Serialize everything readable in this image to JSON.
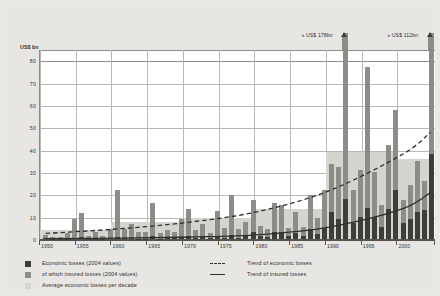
{
  "chart_data": {
    "type": "bar",
    "title": "",
    "xlabel": "",
    "ylabel": "US$ bn",
    "ylim": [
      0,
      85
    ],
    "xlim": [
      1950,
      2004
    ],
    "grid": true,
    "yticks": [
      0,
      10,
      20,
      30,
      40,
      50,
      60,
      70,
      80
    ],
    "ytick_labels": [
      "0",
      "10",
      "20",
      "30",
      "40",
      "50",
      "60",
      "70",
      "80"
    ],
    "xticks": [
      1950,
      1955,
      1960,
      1965,
      1970,
      1975,
      1980,
      1985,
      1990,
      1995,
      2000
    ],
    "xtick_labels": [
      "1950",
      "1955",
      "1960",
      "1965",
      "1970",
      "1975",
      "1980",
      "1985",
      "1990",
      "1995",
      "2000"
    ],
    "legend_position": "below-plot",
    "years": [
      1950,
      1951,
      1952,
      1953,
      1954,
      1955,
      1956,
      1957,
      1958,
      1959,
      1960,
      1961,
      1962,
      1963,
      1964,
      1965,
      1966,
      1967,
      1968,
      1969,
      1970,
      1971,
      1972,
      1973,
      1974,
      1975,
      1976,
      1977,
      1978,
      1979,
      1980,
      1981,
      1982,
      1983,
      1984,
      1985,
      1986,
      1987,
      1988,
      1989,
      1990,
      1991,
      1992,
      1993,
      1994,
      1995,
      1996,
      1997,
      1998,
      1999,
      2000,
      2001,
      2002,
      2003,
      2004
    ],
    "series": [
      {
        "name": "Economic losses (2004 values)",
        "color": "#8d8d88",
        "values": [
          2.0,
          1.0,
          1.0,
          2.5,
          9.0,
          11.5,
          1.5,
          3.0,
          1.5,
          4.5,
          22.0,
          4.5,
          6.5,
          3.0,
          3.0,
          16.0,
          2.5,
          4.0,
          3.0,
          9.0,
          13.5,
          4.0,
          6.5,
          2.5,
          12.5,
          5.0,
          19.5,
          4.5,
          7.5,
          17.5,
          6.0,
          4.5,
          16.0,
          15.0,
          5.0,
          12.0,
          5.5,
          19.5,
          9.5,
          22.0,
          33.5,
          32.0,
          49.5,
          22.0,
          31.0,
          77.0,
          30.0,
          15.0,
          42.0,
          57.5,
          17.5,
          24.0,
          35.0,
          26.0,
          78.0
        ],
        "overflow": [
          {
            "year": 1992,
            "label_value": 178,
            "note": "bar extends beyond axis"
          },
          {
            "year": 2004,
            "label_value": 112,
            "note": "bar extends beyond axis"
          }
        ]
      },
      {
        "name": "of which insured losses (2004 values)",
        "color": "#3d3d3a",
        "values": [
          0.3,
          0.1,
          0.1,
          0.2,
          0.6,
          0.8,
          0.1,
          0.2,
          0.1,
          0.3,
          1.0,
          0.3,
          0.5,
          0.2,
          0.2,
          1.2,
          0.2,
          0.4,
          0.3,
          0.8,
          1.2,
          0.4,
          0.8,
          0.3,
          1.0,
          0.6,
          2.0,
          0.6,
          1.2,
          3.0,
          1.2,
          0.9,
          3.2,
          3.0,
          1.2,
          2.5,
          1.2,
          4.5,
          2.2,
          5.0,
          12.0,
          9.0,
          18.0,
          7.0,
          10.0,
          14.0,
          10.0,
          5.5,
          13.5,
          22.0,
          7.0,
          9.0,
          12.0,
          13.0,
          38.0
        ]
      }
    ],
    "decade_averages": {
      "name": "Average economic losses per decade",
      "color": "#d5d5d0",
      "periods": [
        {
          "label": "1950-1959",
          "value": 4.0
        },
        {
          "label": "1960-1969",
          "value": 7.5
        },
        {
          "label": "1970-1979",
          "value": 9.5
        },
        {
          "label": "1980-1989",
          "value": 13.5
        },
        {
          "label": "1990-1999",
          "value": 39.0
        },
        {
          "label": "2000-2004",
          "value": 36.0
        }
      ]
    },
    "trend_lines": [
      {
        "name": "Trend of economic losses",
        "style": "dashed",
        "color": "#2f2f33",
        "points": [
          [
            1950,
            2.5
          ],
          [
            1960,
            4.5
          ],
          [
            1970,
            7.5
          ],
          [
            1980,
            12.5
          ],
          [
            1990,
            22.0
          ],
          [
            2000,
            38.0
          ],
          [
            2004,
            48.0
          ]
        ]
      },
      {
        "name": "Trend of insured losses",
        "style": "solid",
        "color": "#2f2f33",
        "points": [
          [
            1950,
            0.2
          ],
          [
            1960,
            0.4
          ],
          [
            1970,
            0.9
          ],
          [
            1980,
            2.0
          ],
          [
            1990,
            5.5
          ],
          [
            2000,
            13.5
          ],
          [
            2004,
            21.0
          ]
        ]
      }
    ],
    "annotations": [
      {
        "id": "callout-1992",
        "text": "» US$ 178bn",
        "year": 1992
      },
      {
        "id": "callout-2004",
        "text": "» US$ 112bn",
        "year": 2004
      }
    ]
  },
  "axis": {
    "y_unit_label": "US$ bn"
  },
  "legend": {
    "left_column": [
      {
        "swatch": "#3d3d3a",
        "label": "Economic losses (2004 values)"
      },
      {
        "swatch": "#8d8d88",
        "label": "of which insured losses (2004 values)"
      },
      {
        "swatch": "#d5d5d0",
        "label": "Average economic losses per decade"
      }
    ],
    "right_column": [
      {
        "style": "dashed",
        "label": "Trend of economic losses"
      },
      {
        "style": "solid",
        "label": "Trend of insured losses"
      }
    ]
  }
}
